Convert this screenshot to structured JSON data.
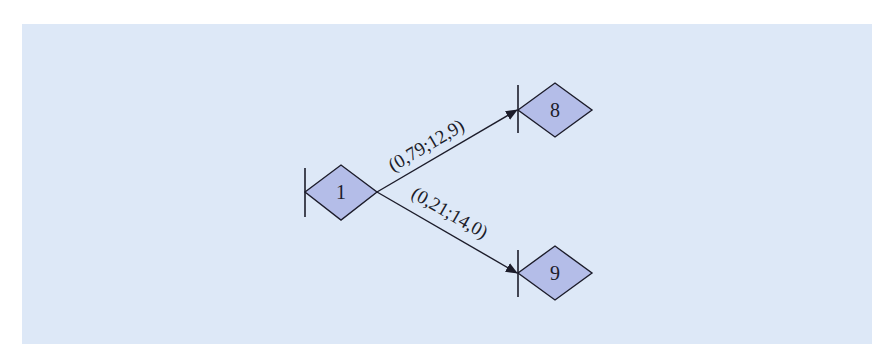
{
  "diagram": {
    "background_color": "#dde8f7",
    "node_fill": "#b4bde8",
    "stroke_color": "#1c1c2a",
    "nodes": [
      {
        "id": "1",
        "label": "1"
      },
      {
        "id": "8",
        "label": "8"
      },
      {
        "id": "9",
        "label": "9"
      }
    ],
    "edges": [
      {
        "from": "1",
        "to": "8",
        "label": "(0,79;12,9)"
      },
      {
        "from": "1",
        "to": "9",
        "label": "(0,21;14,0)"
      }
    ]
  }
}
